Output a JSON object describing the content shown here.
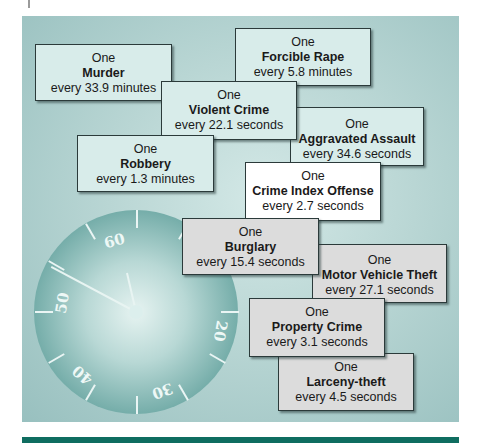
{
  "panel": {
    "colors": {
      "violent_box": "#d8ecea",
      "index_box": "#ffffff",
      "property_box": "#dcdcdc",
      "footer_bar": "#0f6d60"
    }
  },
  "clock": {
    "labels": [
      "60",
      "50",
      "40",
      "30",
      "20"
    ]
  },
  "boxes": [
    {
      "prefix": "One",
      "name": "Murder",
      "frequency": "every 33.9 minutes",
      "category": "violent"
    },
    {
      "prefix": "One",
      "name": "Forcible Rape",
      "frequency": "every 5.8 minutes",
      "category": "violent"
    },
    {
      "prefix": "One",
      "name": "Violent Crime",
      "frequency": "every 22.1 seconds",
      "category": "violent"
    },
    {
      "prefix": "One",
      "name": "Aggravated Assault",
      "frequency": "every 34.6 seconds",
      "category": "violent"
    },
    {
      "prefix": "One",
      "name": "Robbery",
      "frequency": "every 1.3 minutes",
      "category": "violent"
    },
    {
      "prefix": "One",
      "name": "Crime Index Offense",
      "frequency": "every 2.7 seconds",
      "category": "index"
    },
    {
      "prefix": "One",
      "name": "Burglary",
      "frequency": "every 15.4 seconds",
      "category": "property"
    },
    {
      "prefix": "One",
      "name": "Motor Vehicle Theft",
      "frequency": "every 27.1 seconds",
      "category": "property"
    },
    {
      "prefix": "One",
      "name": "Property Crime",
      "frequency": "every 3.1 seconds",
      "category": "property"
    },
    {
      "prefix": "One",
      "name": "Larceny-theft",
      "frequency": "every 4.5 seconds",
      "category": "property"
    }
  ]
}
